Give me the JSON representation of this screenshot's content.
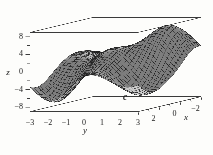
{
  "figure": {
    "label": "c"
  },
  "axes": {
    "z": {
      "label": "z",
      "ticks": [
        8,
        4,
        0,
        -4,
        -8
      ],
      "minor_ticks": [
        6,
        2,
        -2,
        -6
      ],
      "range": [
        -9,
        9
      ]
    },
    "y": {
      "label": "y",
      "ticks": [
        -3,
        -2,
        -1,
        0,
        1,
        2,
        3
      ],
      "minor_ticks": [],
      "range": [
        -3,
        3
      ]
    },
    "x": {
      "label": "x",
      "ticks": [
        2,
        0,
        -2
      ],
      "minor_ticks": [
        3,
        1,
        -1,
        -3
      ],
      "range": [
        -3,
        3
      ]
    }
  },
  "chart_data": {
    "type": "surface",
    "title": "",
    "x_range": [
      -3,
      3
    ],
    "y_range": [
      -3,
      3
    ],
    "z_range": [
      -9,
      9
    ],
    "grid": [
      32,
      32
    ],
    "box": true,
    "features": [
      {
        "kind": "valley",
        "x": 2.4,
        "y": -1.8,
        "z": -7.5
      },
      {
        "kind": "valley",
        "x": 1.7,
        "y": 2.4,
        "z": -6.0
      },
      {
        "kind": "peak",
        "x": 0.5,
        "y": -0.2,
        "z": 4.2
      },
      {
        "kind": "peak",
        "x": -2.1,
        "y": 1.75,
        "z": 8.2
      },
      {
        "kind": "peak",
        "x": -1.6,
        "y": -2.7,
        "z": 2.2
      },
      {
        "kind": "saddle-dip",
        "x": -2.7,
        "y": -0.6,
        "z": -2.0
      },
      {
        "kind": "wall-dip",
        "x": -0.9,
        "y": 3.3,
        "z": -3.5
      }
    ],
    "surface_model": {
      "form": "sum of gaussian bumps amp*exp(-((x-cx)^2/(2*sx^2)+(y-cy)^2/(2*sy^2)))",
      "bumps": [
        {
          "amp": -7.5,
          "cx": 2.4,
          "cy": -1.8,
          "sx": 1.35,
          "sy": 1.05
        },
        {
          "amp": -6.0,
          "cx": 1.7,
          "cy": 2.4,
          "sx": 1.25,
          "sy": 1.05
        },
        {
          "amp": 4.2,
          "cx": 0.5,
          "cy": -0.2,
          "sx": 1.35,
          "sy": 0.95
        },
        {
          "amp": 8.2,
          "cx": -2.1,
          "cy": 1.75,
          "sx": 1.35,
          "sy": 1.05
        },
        {
          "amp": 2.2,
          "cx": -1.6,
          "cy": -2.7,
          "sx": 1.5,
          "sy": 1.0
        },
        {
          "amp": -2.0,
          "cx": -2.7,
          "cy": -0.6,
          "sx": 1.1,
          "sy": 0.95
        },
        {
          "amp": -3.5,
          "cx": -0.9,
          "cy": 3.3,
          "sx": 1.2,
          "sy": 0.9
        }
      ]
    }
  },
  "colors": {
    "background": "#fdfdfb",
    "mesh_line": "#1e1e1e",
    "surface_light": "#ebebeb",
    "surface_dark": "#585858",
    "box_line": "#3a3a3a",
    "text": "#1a1a1a"
  }
}
